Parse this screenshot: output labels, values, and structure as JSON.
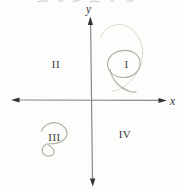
{
  "figure": {
    "axes": {
      "x_label": "x",
      "y_label": "y"
    },
    "quadrants": [
      {
        "numeral": "I",
        "position": "upper-right",
        "circled": true
      },
      {
        "numeral": "II",
        "position": "upper-left",
        "circled": false
      },
      {
        "numeral": "III",
        "position": "lower-left",
        "circled": true
      },
      {
        "numeral": "IV",
        "position": "lower-right",
        "circled": false
      }
    ],
    "annotations": [
      {
        "type": "hand-drawn-oval-with-tail",
        "around": "I"
      },
      {
        "type": "faint-pencil-arc",
        "around": "I"
      },
      {
        "type": "hand-drawn-loop-with-curl",
        "around": "III"
      }
    ],
    "colors": {
      "background": "#fdfdfc",
      "axis_line": "#8a8a8a",
      "arrowhead": "#333333",
      "label_text": "#3a3a3a",
      "pencil": "#b3ada2",
      "pencil_faint": "#dcd7cd"
    }
  }
}
